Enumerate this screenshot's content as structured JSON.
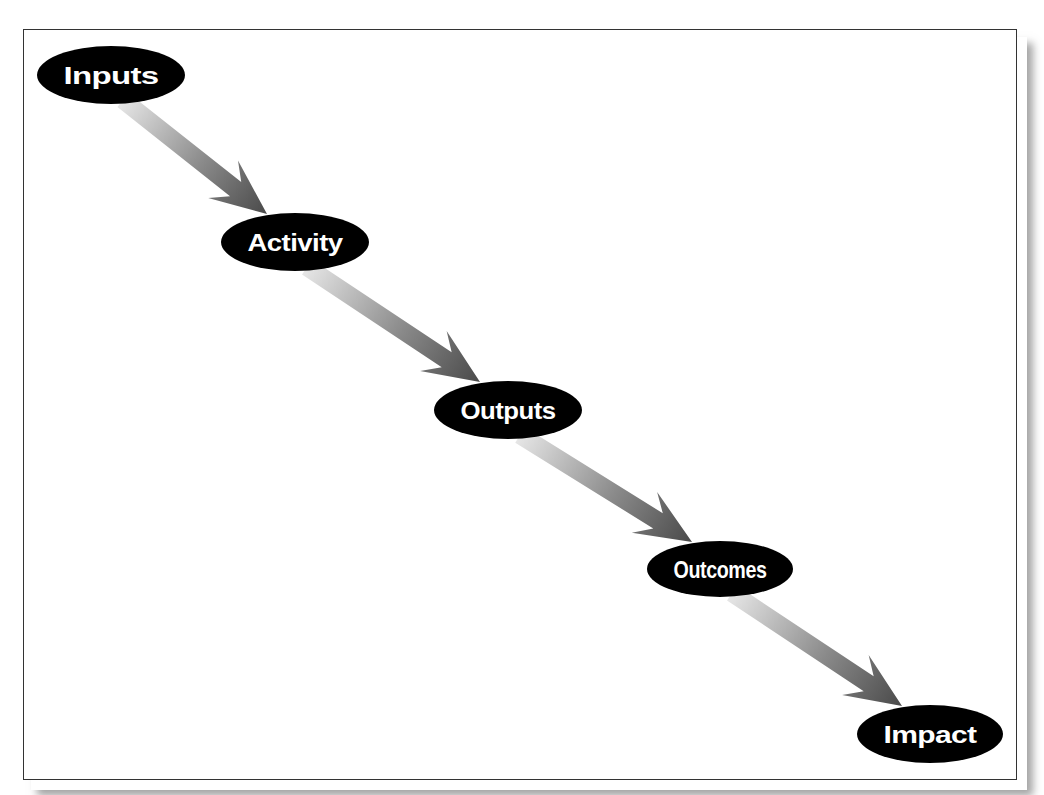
{
  "diagram": {
    "type": "flow",
    "direction": "top-left to bottom-right",
    "colors": {
      "node_fill": "#000000",
      "node_text": "#ffffff",
      "arrow_start": "#e2e2e2",
      "arrow_end": "#4f4f4f",
      "frame_border": "#333333"
    },
    "nodes": [
      {
        "id": "inputs",
        "label": "Inputs",
        "cx": 111,
        "cy": 75,
        "rx": 74,
        "ry": 29
      },
      {
        "id": "activity",
        "label": "Activity",
        "cx": 295,
        "cy": 242,
        "rx": 74,
        "ry": 29
      },
      {
        "id": "outputs",
        "label": "Outputs",
        "cx": 508,
        "cy": 410,
        "rx": 74,
        "ry": 29
      },
      {
        "id": "outcomes",
        "label": "Outcomes",
        "cx": 720,
        "cy": 569,
        "rx": 73,
        "ry": 28
      },
      {
        "id": "impact",
        "label": "Impact",
        "cx": 930,
        "cy": 734,
        "rx": 73,
        "ry": 29
      }
    ],
    "edges": [
      {
        "from": "inputs",
        "to": "activity"
      },
      {
        "from": "activity",
        "to": "outputs"
      },
      {
        "from": "outputs",
        "to": "outcomes"
      },
      {
        "from": "outcomes",
        "to": "impact"
      }
    ]
  }
}
